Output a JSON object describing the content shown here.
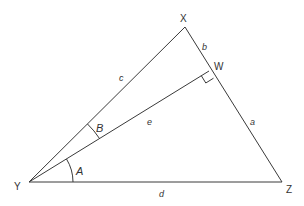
{
  "diagram": {
    "type": "triangle",
    "colors": {
      "stroke": "#3a3a3a",
      "text": "#333333",
      "background": "#ffffff"
    },
    "vertices": {
      "X": {
        "label": "X",
        "x": 185,
        "y": 27
      },
      "Y": {
        "label": "Y",
        "x": 29,
        "y": 182
      },
      "Z": {
        "label": "Z",
        "x": 282,
        "y": 182
      },
      "W": {
        "label": "W",
        "x": 209,
        "y": 71
      }
    },
    "segments": {
      "XY": {
        "label": "c"
      },
      "XW": {
        "label": "b"
      },
      "WZ": {
        "label": "a"
      },
      "YW": {
        "label": "e"
      },
      "YZ": {
        "label": "d"
      }
    },
    "angles": {
      "A": {
        "label": "A",
        "between": "YZ and YW"
      },
      "B": {
        "label": "B",
        "between": "YW and YX"
      },
      "right_angle": {
        "at": "W",
        "between": "YW and XZ"
      }
    }
  }
}
